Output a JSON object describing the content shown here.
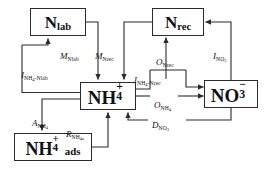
{
  "diagram": {
    "background_color": "#ffffff",
    "line_color": "#2b2b2b",
    "text_color": "#111111",
    "nodes": [
      {
        "id": "nlab",
        "name": "N_lab",
        "base": "N",
        "sub": "lab",
        "sup": "",
        "suffix": ""
      },
      {
        "id": "nrec",
        "name": "N_rec",
        "base": "N",
        "sub": "rec",
        "sup": "",
        "suffix": ""
      },
      {
        "id": "nh4",
        "name": "NH4+",
        "base": "NH",
        "sub": "4",
        "sup": "+",
        "suffix": ""
      },
      {
        "id": "no3",
        "name": "NO3-",
        "base": "NO",
        "sub": "3",
        "sup": "−",
        "suffix": ""
      },
      {
        "id": "nh4ads",
        "name": "NH4+ ads",
        "base": "NH",
        "sub": "4",
        "sup": "+",
        "suffix": "ads"
      }
    ],
    "flux_labels": [
      {
        "id": "i-nh4-nlab",
        "var": "I",
        "sub": "NH",
        "sub_num": "4",
        "sub_tail": "-Nlab",
        "text": "I_NH4-Nlab",
        "from": "NH4+",
        "to": "N_lab"
      },
      {
        "id": "m-nlab",
        "var": "M",
        "sub": "Nlab",
        "sub_num": "",
        "sub_tail": "",
        "text": "M_Nlab",
        "from": "N_lab",
        "to": "NH4+"
      },
      {
        "id": "m-nrec",
        "var": "M",
        "sub": "Nrec",
        "sub_num": "",
        "sub_tail": "",
        "text": "M_Nrec",
        "from": "N_rec",
        "to": "NH4+"
      },
      {
        "id": "i-nh4-nrec",
        "var": "I",
        "sub": "NH",
        "sub_num": "4",
        "sub_tail": "-Nrec",
        "text": "I_NH4-Nrec",
        "from": "NH4+",
        "to": "N_rec"
      },
      {
        "id": "o-nrec",
        "var": "O",
        "sub": "Nrec",
        "sub_num": "",
        "sub_tail": "",
        "text": "O_Nrec",
        "from": "NH4+",
        "to": "N_rec"
      },
      {
        "id": "i-no3",
        "var": "I",
        "sub": "NO",
        "sub_num": "3",
        "sub_tail": "",
        "text": "I_NO3",
        "from": "NO3-",
        "to": "N_rec"
      },
      {
        "id": "o-nh4",
        "var": "O",
        "sub": "NH",
        "sub_num": "4",
        "sub_tail": "",
        "text": "O_NH4",
        "from": "NH4+",
        "to": "NO3-"
      },
      {
        "id": "d-no3",
        "var": "D",
        "sub": "NO",
        "sub_num": "3",
        "sub_tail": "",
        "text": "D_NO3",
        "from": "NO3-",
        "to": "NH4+"
      },
      {
        "id": "a-nh4",
        "var": "A",
        "sub": "NH",
        "sub_num": "4",
        "sub_tail": "",
        "text": "A_NH4",
        "from": "NH4+",
        "to": "NH4+ ads"
      },
      {
        "id": "r-nh4a",
        "var": "R",
        "sub": "NH",
        "sub_num": "4a",
        "sub_tail": "",
        "text": "R_NH4a",
        "from": "NH4+ ads",
        "to": "NH4+"
      }
    ]
  }
}
